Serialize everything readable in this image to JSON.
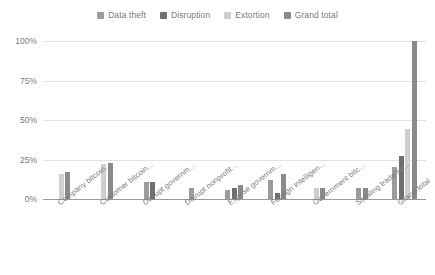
{
  "chart_data": {
    "type": "bar",
    "title": "",
    "subtitle": "",
    "xlabel": "",
    "ylabel": "",
    "ylim": [
      0,
      100
    ],
    "ytick_labels": [
      "0%",
      "25%",
      "50%",
      "75%",
      "100%"
    ],
    "ytick_values": [
      0,
      25,
      50,
      75,
      100
    ],
    "grid": true,
    "legend_position": "top-center",
    "categories": [
      "Company bitcoin...",
      "Customer bitcoin...",
      "Disrupt governm...",
      "Disrupt nonprofit...",
      "Expose governm...",
      "Foreign intelligen...",
      "Government bitc...",
      "Stealing trade se...",
      "Grand total"
    ],
    "series": [
      {
        "name": "Data theft",
        "color": "#9c9c9c",
        "values": [
          null,
          null,
          11,
          7,
          6,
          12,
          null,
          7,
          20
        ]
      },
      {
        "name": "Disruption",
        "color": "#6f6f6f",
        "values": [
          null,
          null,
          11,
          null,
          7,
          4,
          null,
          null,
          27
        ]
      },
      {
        "name": "Extortion",
        "color": "#cfcfcf",
        "values": [
          16,
          22,
          null,
          null,
          null,
          null,
          7,
          null,
          44
        ]
      },
      {
        "name": "Grand total",
        "color": "#8a8a8a",
        "values": [
          17,
          23,
          null,
          null,
          9,
          16,
          7,
          7,
          100
        ]
      }
    ]
  },
  "legend": {
    "items": [
      {
        "label": "Data theft",
        "color": "#9c9c9c"
      },
      {
        "label": "Disruption",
        "color": "#6f6f6f"
      },
      {
        "label": "Extortion",
        "color": "#cfcfcf"
      },
      {
        "label": "Grand total",
        "color": "#8a8a8a"
      }
    ]
  }
}
